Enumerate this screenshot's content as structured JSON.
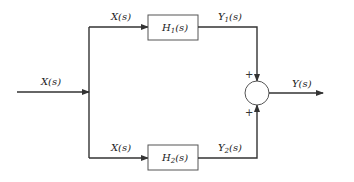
{
  "diagram": {
    "type": "parallel-block-diagram",
    "input_label": "X(s)",
    "top_branch_label": "X(s)",
    "bottom_branch_label": "X(s)",
    "blocks": [
      {
        "id": "H1",
        "name": "H",
        "sub": "1",
        "suffix": "(s)",
        "output_name": "Y",
        "output_sub": "1",
        "output_suffix": "(s)"
      },
      {
        "id": "H2",
        "name": "H",
        "sub": "2",
        "suffix": "(s)",
        "output_name": "Y",
        "output_sub": "2",
        "output_suffix": "(s)"
      }
    ],
    "summing_junction": {
      "top_sign": "+",
      "bottom_sign": "+"
    },
    "output_label": "Y(s)",
    "colors": {
      "line": "#333333",
      "box_border": "#555555",
      "background": "#ffffff"
    }
  }
}
